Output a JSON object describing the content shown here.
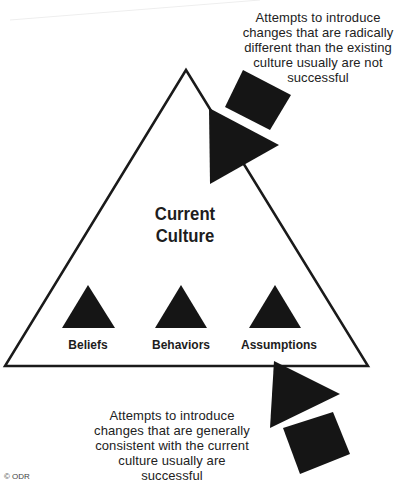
{
  "diagram": {
    "type": "conceptual-diagram",
    "center_title": {
      "line1": "Current",
      "line2": "Culture"
    },
    "elements": [
      {
        "label": "Beliefs",
        "icon": "triangle-icon"
      },
      {
        "label": "Behaviors",
        "icon": "triangle-icon"
      },
      {
        "label": "Assumptions",
        "icon": "triangle-icon"
      }
    ],
    "top_caption": {
      "lines": [
        "Attempts to introduce",
        "changes that are radically",
        "different than the existing",
        "culture usually are not",
        "successful"
      ]
    },
    "bottom_caption": {
      "lines": [
        "Attempts to introduce",
        "changes that are generally",
        "consistent with the current",
        "culture usually are",
        "successful"
      ]
    },
    "copyright": "© ODR",
    "colors": {
      "ink": "#1a1a1a",
      "background": "#ffffff"
    }
  }
}
